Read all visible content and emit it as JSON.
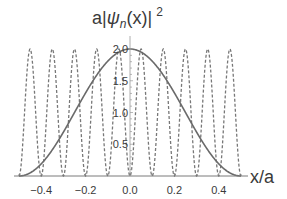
{
  "chart_data": {
    "type": "line",
    "title": "",
    "ylabel": "a|ψn(x)|²",
    "ylabel_parts": {
      "prefix": "a|",
      "psi": "ψ",
      "sub": "n",
      "suffix": "(x)|",
      "sup": "2"
    },
    "xlabel": "x/a",
    "xlim": [
      -0.5,
      0.5
    ],
    "ylim": [
      0,
      2.0
    ],
    "x_ticks": [
      -0.4,
      -0.2,
      0.0,
      0.2,
      0.4
    ],
    "x_tick_labels": [
      "−0.4",
      "−0.2",
      "0.0",
      "0.2",
      "0.4"
    ],
    "y_ticks": [
      0.5,
      1.0,
      1.5,
      2.0
    ],
    "y_tick_labels": [
      "0.5",
      "1.0",
      "1.5",
      "2.0"
    ],
    "grid": false,
    "legend": null,
    "series": [
      {
        "name": "n=1",
        "style": "solid",
        "formula": "2*cos(pi*x)^2",
        "x": [
          -0.5,
          -0.4,
          -0.3,
          -0.2,
          -0.1,
          0.0,
          0.1,
          0.2,
          0.3,
          0.4,
          0.5
        ],
        "values": [
          0.0,
          0.19,
          0.69,
          1.31,
          1.81,
          2.0,
          1.81,
          1.31,
          0.69,
          0.19,
          0.0
        ]
      },
      {
        "name": "n=10",
        "style": "dashed",
        "formula": "2*sin(10*pi*x)^2",
        "x": [
          -0.5,
          -0.45,
          -0.4,
          -0.35,
          -0.3,
          -0.25,
          -0.2,
          -0.15,
          -0.1,
          -0.05,
          0.0,
          0.05,
          0.1,
          0.15,
          0.2,
          0.25,
          0.3,
          0.35,
          0.4,
          0.45,
          0.5
        ],
        "values": [
          0,
          2,
          0,
          2,
          0,
          2,
          0,
          2,
          0,
          2,
          0,
          2,
          0,
          2,
          0,
          2,
          0,
          2,
          0,
          2,
          0
        ]
      }
    ],
    "colors": {
      "line": "#6e6e6e",
      "axis": "#7a7a7a",
      "text": "#3a3a3a"
    }
  }
}
